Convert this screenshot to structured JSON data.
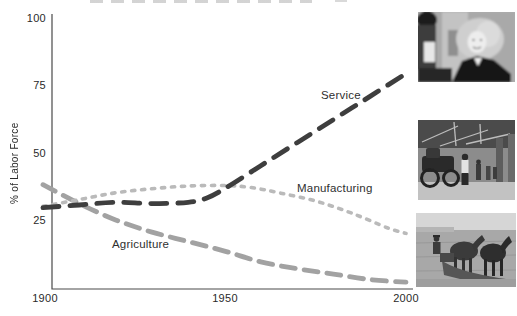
{
  "chart_data": {
    "type": "line",
    "title": "",
    "ylabel": "% of Labor Force",
    "xlabel": "",
    "x_ticks": [
      "1900",
      "1950",
      "2000"
    ],
    "y_ticks": [
      "100",
      "75",
      "50",
      "25"
    ],
    "xlim": [
      1900,
      2000
    ],
    "ylim": [
      0,
      100
    ],
    "grid": false,
    "legend_position": "inline-labels-on-lines",
    "series": [
      {
        "name": "Agriculture",
        "color": "#a2a2a2",
        "style": "long-dash",
        "x": [
          1900,
          1910,
          1920,
          1930,
          1940,
          1950,
          1960,
          1970,
          1980,
          1990,
          2000
        ],
        "values": [
          38.5,
          31.5,
          25.5,
          21,
          17.5,
          14,
          10,
          7.5,
          5.5,
          3.5,
          2.5
        ]
      },
      {
        "name": "Manufacturing",
        "color": "#bababa",
        "style": "dotted",
        "x": [
          1900,
          1910,
          1920,
          1930,
          1940,
          1950,
          1957,
          1965,
          1975,
          1985,
          1995,
          2000
        ],
        "values": [
          30.5,
          33,
          35.5,
          37,
          38,
          38.2,
          37.5,
          35.5,
          32.5,
          28,
          22.5,
          20.5
        ]
      },
      {
        "name": "Service",
        "color": "#3e3e3e",
        "style": "long-dash-bold",
        "x": [
          1900,
          1910,
          1920,
          1930,
          1940,
          1945,
          1950,
          1960,
          1970,
          1980,
          1990,
          2000
        ],
        "values": [
          30,
          31,
          32,
          31.5,
          32,
          33.5,
          37,
          45.5,
          54,
          62.5,
          71,
          79.5
        ]
      }
    ],
    "axis_color": "#4a4a4a",
    "text_color": "#2a2a2a"
  },
  "photos": [
    {
      "name": "service-photo",
      "description": "black-and-white photo of smiling female office worker (service sector)"
    },
    {
      "name": "manufacturing-photo",
      "description": "black-and-white photo of early automobile factory floor"
    },
    {
      "name": "agriculture-photo",
      "description": "black-and-white photo of farmer plowing with a team of horses"
    }
  ],
  "artifact": {
    "description": "faint cropped text remnant at top edge"
  }
}
